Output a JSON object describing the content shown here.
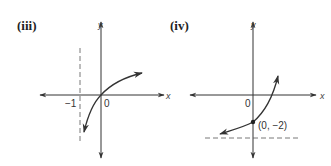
{
  "panels": [
    {
      "label": "(iii)",
      "x_axis_label": "x",
      "y_axis_label": "y",
      "origin_label": "0",
      "asymptote_label": "−1",
      "asymptote": "vertical dashed line at x = -1",
      "curve": "increasing curve through origin, approaching x = -1 downward"
    },
    {
      "label": "(iv)",
      "x_axis_label": "x",
      "y_axis_label": "y",
      "origin_label": "0",
      "point_label": "(0, −2)",
      "asymptote": "horizontal dashed line below point (0, -2)",
      "curve": "increasing curve through (0,-2), approaching horizontal asymptote to the left"
    }
  ],
  "colors": {
    "ink": "#333333",
    "background": "#ffffff"
  }
}
